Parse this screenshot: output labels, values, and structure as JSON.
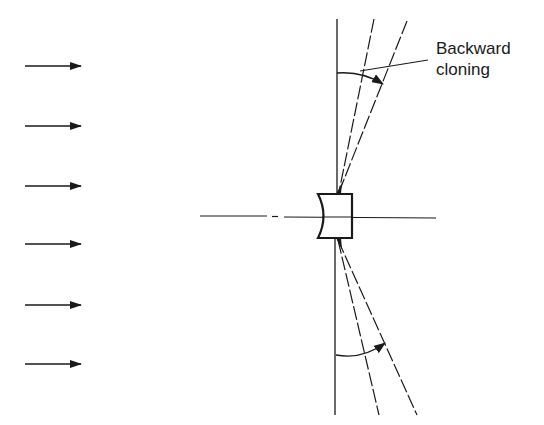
{
  "diagram": {
    "annotation": {
      "line1": "Backward",
      "line2": "cloning"
    },
    "colors": {
      "ink": "#1a1a1a",
      "background": "#ffffff"
    },
    "incident_arrows": {
      "count": 6,
      "direction": "right",
      "x_start": 25,
      "x_end": 81,
      "y_positions": [
        66,
        126,
        186,
        244,
        305,
        364
      ]
    },
    "optical_axis": {
      "y": 217,
      "x_start": 200,
      "x_end": 436,
      "style": "dash-dot"
    },
    "lens": {
      "type": "plano-concave",
      "x_left": 318,
      "x_right": 352,
      "y_top": 194,
      "y_bottom": 238
    },
    "rays": {
      "vertical_line": "solid",
      "cone_lines": "dashed",
      "arc_arrows": 2
    }
  }
}
